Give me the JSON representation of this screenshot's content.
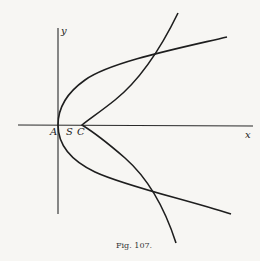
{
  "figure": {
    "caption": "Fig. 107.",
    "labels": {
      "y_axis": "y",
      "x_axis": "x",
      "point_A": "A",
      "point_S": "S",
      "point_C": "C"
    },
    "colors": {
      "ink": "#1e1e1e",
      "paper": "#f7f6f3"
    },
    "elements": [
      {
        "name": "x-axis",
        "description": "horizontal axis through A"
      },
      {
        "name": "y-axis",
        "description": "vertical axis through A"
      },
      {
        "name": "parabola-1",
        "description": "parabola with vertex at A opening right"
      },
      {
        "name": "parabola-2",
        "description": "narrower parabola with vertex at C opening right"
      }
    ]
  }
}
